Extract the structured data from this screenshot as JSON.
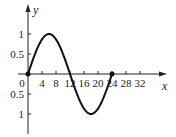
{
  "chart_data": {
    "type": "line",
    "title": "",
    "xlabel": "x",
    "ylabel": "y",
    "xlim": [
      0,
      36
    ],
    "ylim": [
      -1.3,
      1.3
    ],
    "grid": false,
    "legend": null,
    "x_ticks": [
      0,
      4,
      8,
      12,
      16,
      20,
      24,
      28,
      32
    ],
    "x_tick_labels": [
      "0",
      "4",
      "8",
      "12",
      "16",
      "20",
      "24",
      "28",
      "32"
    ],
    "y_ticks": [
      1,
      0.5,
      -0.5,
      -1
    ],
    "y_tick_labels": [
      "1",
      "0.5",
      "0.5",
      "1"
    ],
    "series": [
      {
        "name": "y = sin(2πx/24)",
        "x": [
          0,
          2,
          4,
          6,
          8,
          10,
          12,
          14,
          16,
          18,
          20,
          22,
          24
        ],
        "values": [
          0,
          0.5,
          0.87,
          1,
          0.87,
          0.5,
          0,
          -0.5,
          -0.87,
          -1,
          -0.87,
          -0.5,
          0
        ]
      }
    ],
    "annotations": [
      {
        "type": "point",
        "x": 0,
        "y": 0
      },
      {
        "type": "point",
        "x": 24,
        "y": 0
      }
    ]
  }
}
